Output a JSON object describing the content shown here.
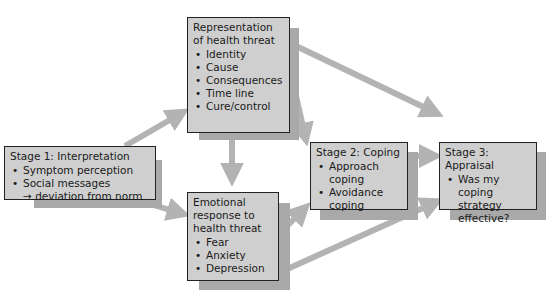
{
  "diagram": {
    "colors": {
      "box_fill": "#cfcfcf",
      "box_border": "#222222",
      "shadow": "#a9a9a9",
      "arrow": "#b3b3b3"
    },
    "nodes": {
      "stage1": {
        "title": "Stage 1: Interpretation",
        "items": [
          "Symptom perception",
          "Social messages"
        ],
        "subline": "→ deviation from norm"
      },
      "representation": {
        "title": "Representation of health threat",
        "items": [
          "Identity",
          "Cause",
          "Consequences",
          "Time line",
          "Cure/control"
        ]
      },
      "emotional": {
        "title": "Emotional response to health threat",
        "items": [
          "Fear",
          "Anxiety",
          "Depression"
        ]
      },
      "stage2": {
        "title": "Stage 2: Coping",
        "items": [
          "Approach coping",
          "Avoidance coping"
        ]
      },
      "stage3": {
        "title": "Stage 3: Appraisal",
        "items": [
          "Was my coping strategy effective?"
        ]
      }
    },
    "edges": [
      {
        "from": "stage1",
        "to": "representation"
      },
      {
        "from": "stage1",
        "to": "emotional"
      },
      {
        "from": "representation",
        "to": "emotional"
      },
      {
        "from": "representation",
        "to": "stage2"
      },
      {
        "from": "representation",
        "to": "stage3"
      },
      {
        "from": "emotional",
        "to": "stage2"
      },
      {
        "from": "emotional",
        "to": "stage3"
      },
      {
        "from": "stage2",
        "to": "stage3"
      }
    ]
  }
}
